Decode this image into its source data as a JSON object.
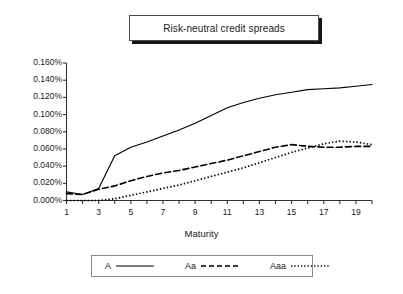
{
  "title": {
    "text": "Risk-neutral credit spreads"
  },
  "axis": {
    "x_title": "Maturity",
    "y_ticks": [
      "0.000%",
      "0.020%",
      "0.040%",
      "0.060%",
      "0.080%",
      "0.100%",
      "0.120%",
      "0.140%",
      "0.160%"
    ],
    "x_ticks": [
      "1",
      "3",
      "5",
      "7",
      "9",
      "11",
      "13",
      "15",
      "17",
      "19"
    ]
  },
  "legend": {
    "items": [
      {
        "label": "A",
        "style": "solid",
        "icon": "solid-line-icon"
      },
      {
        "label": "Aa",
        "style": "dashed",
        "icon": "dashed-line-icon"
      },
      {
        "label": "Aaa",
        "style": "dotted",
        "icon": "dotted-line-icon"
      }
    ]
  },
  "colors": {
    "line": "#000000",
    "axis": "#333333",
    "text": "#1a1a1a",
    "title_border": "#4a4a4a",
    "title_shadow": "#151515",
    "legend_border": "#8a8a8a",
    "background": "#ffffff"
  },
  "chart_data": {
    "type": "line",
    "title": "Risk-neutral credit spreads",
    "xlabel": "Maturity",
    "ylabel": "",
    "xlim": [
      1,
      20
    ],
    "ylim": [
      0,
      0.16
    ],
    "y_unit": "percent",
    "grid": false,
    "legend_position": "bottom",
    "x": [
      1,
      2,
      3,
      4,
      5,
      6,
      7,
      8,
      9,
      10,
      11,
      12,
      13,
      14,
      15,
      16,
      17,
      18,
      19,
      20
    ],
    "series": [
      {
        "name": "A",
        "style": "solid",
        "values": [
          0.01,
          0.007,
          0.014,
          0.052,
          0.062,
          0.068,
          0.075,
          0.082,
          0.09,
          0.099,
          0.108,
          0.114,
          0.119,
          0.123,
          0.126,
          0.129,
          0.13,
          0.131,
          0.133,
          0.135
        ]
      },
      {
        "name": "Aa",
        "style": "dashed",
        "values": [
          0.008,
          0.007,
          0.013,
          0.017,
          0.023,
          0.028,
          0.032,
          0.035,
          0.039,
          0.043,
          0.047,
          0.052,
          0.057,
          0.062,
          0.065,
          0.063,
          0.062,
          0.062,
          0.063,
          0.063
        ]
      },
      {
        "name": "Aaa",
        "style": "dotted",
        "values": [
          0.0,
          0.0,
          0.0,
          0.002,
          0.006,
          0.01,
          0.014,
          0.018,
          0.023,
          0.028,
          0.033,
          0.038,
          0.044,
          0.05,
          0.056,
          0.061,
          0.066,
          0.069,
          0.068,
          0.065
        ]
      }
    ]
  }
}
